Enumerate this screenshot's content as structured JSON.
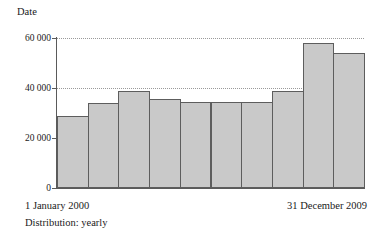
{
  "chart_data": {
    "type": "bar",
    "title": "Date",
    "xlabel": "",
    "ylabel": "",
    "ylim": [
      0,
      60000
    ],
    "grid": true,
    "legend": null,
    "categories": [
      "2000",
      "2001",
      "2002",
      "2003",
      "2004",
      "2005",
      "2006",
      "2007",
      "2008",
      "2009"
    ],
    "values": [
      29000,
      34000,
      39000,
      35500,
      34500,
      34500,
      34500,
      39000,
      58000,
      54000
    ],
    "ytick_labels": [
      "0",
      "20 000",
      "40 000",
      "60 000"
    ],
    "ytick_values": [
      0,
      20000,
      40000,
      60000
    ],
    "annotations": {
      "range_start": "1 January 2000",
      "range_end": "31 December 2009",
      "distribution": "Distribution: yearly"
    },
    "colors": {
      "bar_fill": "#c9c9c9",
      "bar_stroke": "#5d5d5d",
      "axis": "#5a5a5a",
      "grid": "#9a9a9a",
      "text": "#1a1a1a"
    }
  },
  "axis": {
    "y": {
      "ticks": [
        {
          "label": "60 000",
          "value": 60000
        },
        {
          "label": "40 000",
          "value": 40000
        },
        {
          "label": "20 000",
          "value": 20000
        },
        {
          "label": "0",
          "value": 0
        }
      ]
    }
  },
  "title": "Date",
  "footer": {
    "start_date": "1 January 2000",
    "end_date": "31 December 2009",
    "distribution": "Distribution: yearly"
  }
}
